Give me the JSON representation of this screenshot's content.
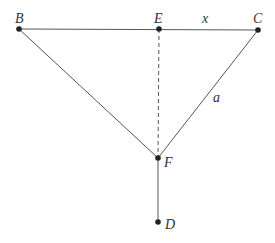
{
  "diagram": {
    "points": [
      {
        "name": "B",
        "x": 19,
        "y": 29
      },
      {
        "name": "E",
        "x": 159,
        "y": 29
      },
      {
        "name": "C",
        "x": 258,
        "y": 30
      },
      {
        "name": "F",
        "x": 158,
        "y": 158
      },
      {
        "name": "D",
        "x": 158,
        "y": 222
      }
    ],
    "labels": {
      "B": "B",
      "E": "E",
      "C": "C",
      "F": "F",
      "D": "D",
      "x": "x",
      "a": "a"
    },
    "segments": [
      {
        "from": "B",
        "to": "C",
        "style": "solid"
      },
      {
        "from": "B",
        "to": "F",
        "style": "solid"
      },
      {
        "from": "C",
        "to": "F",
        "style": "solid",
        "label": "a"
      },
      {
        "from": "E",
        "to": "F",
        "style": "dashed"
      },
      {
        "from": "F",
        "to": "D",
        "style": "solid"
      },
      {
        "from": "E",
        "to": "C",
        "style": "solid",
        "label": "x"
      }
    ]
  }
}
